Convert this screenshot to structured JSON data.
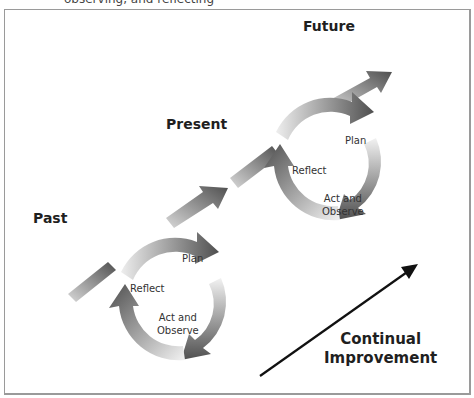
{
  "caption": "observing, and reflecting",
  "eras": {
    "past": "Past",
    "present": "Present",
    "future": "Future"
  },
  "cycles": [
    {
      "plan": "Plan",
      "reflect": "Reflect",
      "act_line1": "Act and",
      "act_line2": "Observe"
    },
    {
      "plan": "Plan",
      "reflect": "Reflect",
      "act_line1": "Act and",
      "act_line2": "Observe"
    }
  ],
  "improvement": {
    "line1": "Continual",
    "line2": "Improvement"
  },
  "colors": {
    "arrow_dark": "#555555",
    "arrow_light": "#e6e6e6",
    "frame": "#9a9a9a",
    "text": "#1f1f1f"
  }
}
